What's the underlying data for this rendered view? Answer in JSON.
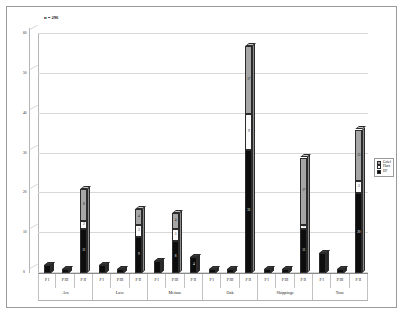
{
  "annotations": {
    "n_label": "n = 296"
  },
  "legend": {
    "position": "right-middle",
    "items": [
      {
        "label": "Grief",
        "color": "#a6a6a6",
        "key": "grief"
      },
      {
        "label": "Hurt",
        "color": "#fdfdfd",
        "key": "hurt"
      },
      {
        "label": "EF",
        "color": "#0d0d0d",
        "key": "ef"
      }
    ]
  },
  "axes": {
    "y_ticks": [
      "0",
      "10",
      "20",
      "30",
      "40",
      "50",
      "60"
    ],
    "y_max": 60,
    "y_min": 0,
    "category_labels": [
      "P I",
      "P III",
      "P II",
      "P I",
      "P III",
      "P II",
      "P I",
      "P III",
      "P II",
      "P I",
      "P III",
      "P II",
      "P I",
      "P III",
      "P II",
      "P I",
      "P III",
      "P II"
    ],
    "group_labels": [
      "Ars",
      "Lave",
      "Mefane",
      "Oak",
      "Skippings",
      "Tone"
    ]
  },
  "chart_data": {
    "type": "bar",
    "subtype": "stacked-column-3d",
    "title": "",
    "subtitle": "",
    "xlabel": "",
    "ylabel": "",
    "ylim": [
      0,
      60
    ],
    "grid": true,
    "legend_position": "right",
    "categories": [
      "Ars P I",
      "Ars P III",
      "Ars P II",
      "Lave P I",
      "Lave P III",
      "Lave P II",
      "Mefane P I",
      "Mefane P III",
      "Mefane P II",
      "Oak P I",
      "Oak P III",
      "Oak P II",
      "Skippings P I",
      "Skippings P III",
      "Skippings P II",
      "Tone P I",
      "Tone P III",
      "Tone P II"
    ],
    "groups": [
      "Ars",
      "Lave",
      "Mefane",
      "Oak",
      "Skippings",
      "Tone"
    ],
    "subcategories": [
      "P I",
      "P III",
      "P II"
    ],
    "series": [
      {
        "name": "EF",
        "color": "#0d0d0d",
        "values": [
          2,
          1,
          11,
          2,
          1,
          9,
          3,
          8,
          4,
          1,
          1,
          31,
          1,
          1,
          11,
          5,
          1,
          20
        ]
      },
      {
        "name": "Hurt",
        "color": "#fdfdfd",
        "values": [
          0,
          0,
          2,
          0,
          0,
          3,
          0,
          3,
          0,
          0,
          0,
          9,
          0,
          0,
          1,
          0,
          0,
          3
        ]
      },
      {
        "name": "Grief",
        "color": "#a6a6a6",
        "values": [
          0,
          0,
          8,
          0,
          0,
          4,
          0,
          4,
          0,
          0,
          0,
          17,
          0,
          0,
          17,
          0,
          0,
          13
        ]
      }
    ],
    "totals": [
      2,
      1,
      21,
      2,
      1,
      16,
      3,
      15,
      4,
      1,
      1,
      57,
      1,
      1,
      29,
      5,
      1,
      36
    ],
    "value_labels": {
      "Ars P II": {
        "ef": "11",
        "hurt": "2",
        "grief": "8"
      },
      "Lave P II": {
        "ef": "9",
        "hurt": "3",
        "grief": "4"
      },
      "Mefane P III": {
        "ef": "8",
        "hurt": "3",
        "grief": "4"
      },
      "Mefane P II": {
        "ef": "4"
      },
      "Oak P II": {
        "ef": "31",
        "hurt": "9",
        "grief": "17"
      },
      "Skippings P II": {
        "ef": "11",
        "hurt": "1",
        "grief": "17"
      },
      "Tone P II": {
        "ef": "20",
        "hurt": "3",
        "grief": "13"
      }
    }
  }
}
